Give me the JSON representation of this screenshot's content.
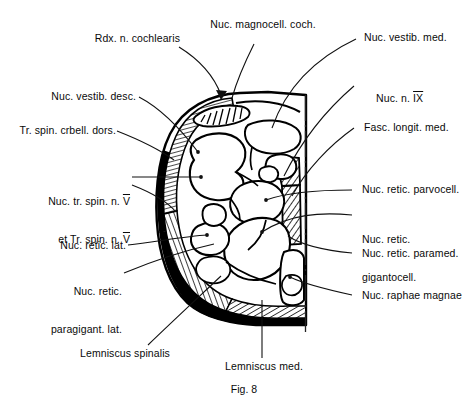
{
  "figure": {
    "caption": "Fig. 8"
  },
  "labels": {
    "rdx_n_cochlearis": "Rdx. n. cochlearis",
    "nuc_magnocell_coch": "Nuc. magnocell. coch.",
    "nuc_vestib_med": "Nuc. vestib. med.",
    "nuc_vestib_desc": "Nuc. vestib. desc.",
    "nuc_n_ix_prefix": "Nuc. n. ",
    "nuc_n_ix_roman": "IX",
    "tr_spin_crbell_dors": "Tr. spin. crbell. dors.",
    "fasc_longit_med": "Fasc. longit. med.",
    "nuc_tr_spin_line1_prefix": "Nuc. tr. spin. n. ",
    "nuc_tr_spin_line1_roman": "V",
    "nuc_tr_spin_line2_prefix": "et Tr. spin. n. ",
    "nuc_tr_spin_line2_roman": "V",
    "nuc_retic_parvocell": "Nuc. retic. parvocell.",
    "nuc_retic_gigantocell_line1": "Nuc. retic.",
    "nuc_retic_gigantocell_line2": "gigantocell.",
    "nuc_retic_lat": "Nuc. retic. lat.",
    "nuc_retic_paramed": "Nuc. retic. paramed.",
    "nuc_retic_paragigant_line1": "Nuc. retic.",
    "nuc_retic_paragigant_line2": "paragigant. lat.",
    "nuc_raphae_magnae": "Nuc. raphae magnae",
    "lemniscus_spinalis": "Lemniscus spinalis",
    "lemniscus_med": "Lemniscus med."
  },
  "colors": {
    "ink": "#000000",
    "paper": "#ffffff",
    "leader": "#111111"
  }
}
